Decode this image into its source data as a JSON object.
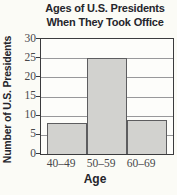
{
  "chart_data": {
    "type": "bar",
    "title": "Ages of U.S. Presidents When They Took Office",
    "title_line1": "Ages of U.S. Presidents",
    "title_line2": "When They Took Office",
    "categories": [
      "40–49",
      "50–59",
      "60–69"
    ],
    "values": [
      8,
      25,
      9
    ],
    "xlabel": "Age",
    "ylabel": "Number of U.S. Presidents",
    "ylim": [
      0,
      30
    ],
    "yticks": [
      0,
      5,
      10,
      15,
      20,
      25,
      30
    ],
    "grid": "horizontal",
    "legend": "none",
    "colors": {
      "background": "#fbfbf6",
      "bar_fill": "#d2d2cf",
      "bar_border": "#5d5d5f",
      "grid_line": "#98989a",
      "axis_border": "#3b3b3d",
      "title_text": "#25252b",
      "tick_text": "#47474a"
    }
  }
}
